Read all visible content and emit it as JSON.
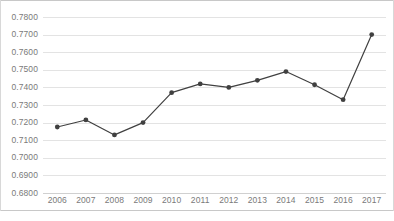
{
  "chart_data": {
    "type": "line",
    "title": "",
    "xlabel": "",
    "ylabel": "",
    "categories": [
      "2006",
      "2007",
      "2008",
      "2009",
      "2010",
      "2011",
      "2012",
      "2013",
      "2014",
      "2015",
      "2016",
      "2017"
    ],
    "values": [
      0.7175,
      0.7215,
      0.713,
      0.72,
      0.737,
      0.742,
      0.74,
      0.744,
      0.749,
      0.7415,
      0.733,
      0.77
    ],
    "series": [
      {
        "name": "",
        "values": [
          0.7175,
          0.7215,
          0.713,
          0.72,
          0.737,
          0.742,
          0.74,
          0.744,
          0.749,
          0.7415,
          0.733,
          0.77
        ]
      }
    ],
    "ylim": [
      0.68,
      0.78
    ],
    "yticks": [
      0.68,
      0.69,
      0.7,
      0.71,
      0.72,
      0.73,
      0.74,
      0.75,
      0.76,
      0.77,
      0.78
    ],
    "ytick_labels": [
      "0.6800",
      "0.6900",
      "0.7000",
      "0.7100",
      "0.7200",
      "0.7300",
      "0.7400",
      "0.7500",
      "0.7600",
      "0.7700",
      "0.7800"
    ],
    "grid": true,
    "legend": "none",
    "line_color": "#404040",
    "marker_color": "#404040",
    "marker": "circle",
    "gridline_color": "#e3e3e3",
    "tick_label_color": "#7a7a7a",
    "background_color": "#ffffff"
  }
}
